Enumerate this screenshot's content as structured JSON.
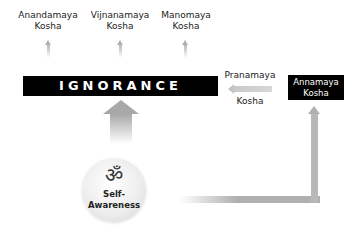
{
  "diagram": {
    "top_labels": [
      {
        "line1": "Anandamaya",
        "line2": "Kosha"
      },
      {
        "line1": "Vijnanamaya",
        "line2": "Kosha"
      },
      {
        "line1": "Manomaya",
        "line2": "Kosha"
      }
    ],
    "ignorance_label": "IGNORANCE",
    "pranamaya": {
      "line1": "Pranamaya",
      "line2": "Kosha"
    },
    "annamaya": {
      "line1": "Annamaya",
      "line2": "Kosha"
    },
    "center": {
      "symbol": "ॐ",
      "line1": "Self-",
      "line2": "Awareness"
    },
    "colors": {
      "box": "#000000",
      "box_text": "#ffffff",
      "arrow": "#b0b0b0",
      "circle": "#ececec"
    }
  }
}
